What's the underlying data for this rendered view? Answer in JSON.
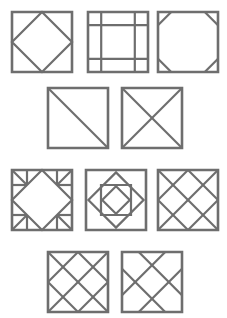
{
  "page": {
    "background_color": "#ffffff",
    "line_color": "#6e6e6e",
    "fill_color": "#ffffff",
    "width": 227,
    "height": 318,
    "row_count": 4,
    "block_count": 10
  },
  "rows": [
    {
      "index": 1,
      "block_count": 3,
      "top": 12
    },
    {
      "index": 2,
      "block_count": 2,
      "top": 88
    },
    {
      "index": 3,
      "block_count": 3,
      "top": 170
    },
    {
      "index": 4,
      "block_count": 2,
      "top": 252
    }
  ],
  "blocks": [
    {
      "id": 1,
      "name": "square-in-a-square",
      "row": 1,
      "column": 1,
      "x": 12,
      "y": 12,
      "size": 60,
      "description": "Outer square with an inscribed diamond joining the edge midpoints",
      "line_count": 8
    },
    {
      "id": 2,
      "name": "nine-patch-grid",
      "row": 1,
      "column": 2,
      "x": 88,
      "y": 12,
      "size": 60,
      "description": "Square divided by two vertical and two horizontal lines into a nine patch with narrow outer bands",
      "line_count": 8
    },
    {
      "id": 3,
      "name": "snowball-octagon",
      "row": 1,
      "column": 3,
      "x": 158,
      "y": 12,
      "size": 60,
      "description": "Square with each of the four corners cut off by a short diagonal, forming an octagon",
      "line_count": 8
    },
    {
      "id": 4,
      "name": "half-square-triangle",
      "row": 2,
      "column": 1,
      "x": 48,
      "y": 88,
      "size": 60,
      "description": "Square split by a single diagonal from top-left to bottom-right",
      "line_count": 5
    },
    {
      "id": 5,
      "name": "hourglass-quarter-square",
      "row": 2,
      "column": 2,
      "x": 122,
      "y": 88,
      "size": 60,
      "description": "Square split by both corner-to-corner diagonals forming four triangles",
      "line_count": 6
    },
    {
      "id": 6,
      "name": "diamond-with-corner-triangle-squares",
      "row": 3,
      "column": 1,
      "x": 12,
      "y": 170,
      "size": 60,
      "description": "Central diamond joining edge midpoints with four corner squares each divided by a diagonal",
      "line_count": 16
    },
    {
      "id": 7,
      "name": "nested-square-diamond",
      "row": 3,
      "column": 2,
      "x": 86,
      "y": 170,
      "size": 60,
      "description": "Four nested shapes alternating square, diamond, square, diamond toward the centre",
      "line_count": 16
    },
    {
      "id": 8,
      "name": "diamond-lattice-four",
      "row": 3,
      "column": 3,
      "x": 158,
      "y": 170,
      "size": 60,
      "description": "Diagonal lattice of four on-point diamonds filling the square",
      "line_count": 8
    },
    {
      "id": 9,
      "name": "diamond-lattice-with-corner-diagonals",
      "row": 4,
      "column": 1,
      "x": 48,
      "y": 252,
      "size": 60,
      "description": "Dense diagonal lattice including the full corner-to-corner diagonals",
      "line_count": 10
    },
    {
      "id": 10,
      "name": "offset-diagonal-lattice",
      "row": 4,
      "column": 2,
      "x": 122,
      "y": 252,
      "size": 60,
      "description": "Offset diagonal lattice of two lines in each direction crossing at the centre",
      "line_count": 8
    }
  ]
}
